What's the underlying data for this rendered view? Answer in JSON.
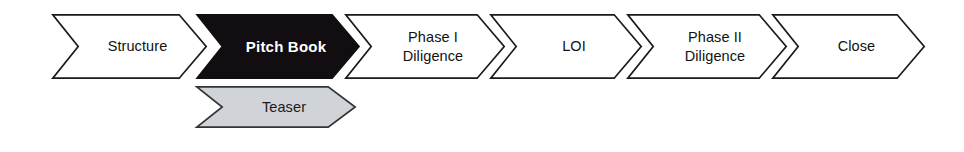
{
  "diagram": {
    "type": "process-flow-chevron",
    "title": "",
    "canvas": {
      "width": 964,
      "height": 152,
      "background": "#ffffff"
    },
    "styles": {
      "default_fill": "#ffffff",
      "default_stroke": "#1a1a1a",
      "active_fill": "#120d10",
      "active_text": "#ffffff",
      "alternate_fill": "#d0d4d8",
      "alternate_stroke": "#333333",
      "text_color": "#111111"
    },
    "rows": [
      {
        "name": "main-process-row",
        "steps": [
          {
            "id": "structure",
            "label": "Structure",
            "state": "default",
            "fill": "#ffffff",
            "stroke": "#1a1a1a",
            "text_color": "#111111",
            "order": 1,
            "x": 52,
            "y": 14,
            "width": 155,
            "height": 65,
            "notch": 27
          },
          {
            "id": "pitch-book",
            "label": "Pitch Book",
            "state": "active",
            "fill": "#120d10",
            "stroke": "#120d10",
            "text_color": "#ffffff",
            "order": 2,
            "x": 196,
            "y": 14,
            "width": 164,
            "height": 65,
            "notch": 27
          },
          {
            "id": "phase-i-diligence",
            "label": "Phase I\nDiligence",
            "state": "default",
            "fill": "#ffffff",
            "stroke": "#1a1a1a",
            "text_color": "#111111",
            "order": 3,
            "x": 345,
            "y": 14,
            "width": 160,
            "height": 65,
            "notch": 27
          },
          {
            "id": "loi",
            "label": "LOI",
            "state": "default",
            "fill": "#ffffff",
            "stroke": "#1a1a1a",
            "text_color": "#111111",
            "order": 4,
            "x": 490,
            "y": 14,
            "width": 152,
            "height": 65,
            "notch": 27
          },
          {
            "id": "phase-ii-diligence",
            "label": "Phase II\nDiligence",
            "state": "default",
            "fill": "#ffffff",
            "stroke": "#1a1a1a",
            "text_color": "#111111",
            "order": 5,
            "x": 627,
            "y": 14,
            "width": 160,
            "height": 65,
            "notch": 27
          },
          {
            "id": "close",
            "label": "Close",
            "state": "default",
            "fill": "#ffffff",
            "stroke": "#1a1a1a",
            "text_color": "#111111",
            "order": 6,
            "x": 772,
            "y": 14,
            "width": 153,
            "height": 65,
            "notch": 27
          }
        ]
      },
      {
        "name": "alternate-process-row",
        "steps": [
          {
            "id": "teaser",
            "label": "Teaser",
            "state": "alternate",
            "fill": "#d0d4d8",
            "stroke": "#333333",
            "text_color": "#1a1a1a",
            "order": 1,
            "x": 196,
            "y": 86,
            "width": 160,
            "height": 42,
            "notch": 27
          }
        ]
      }
    ]
  }
}
